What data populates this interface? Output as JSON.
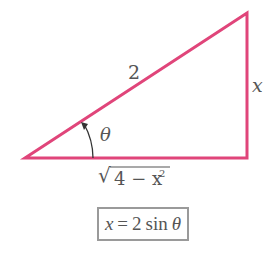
{
  "diagram": {
    "type": "right-triangle",
    "colors": {
      "triangle_stroke": "#e0457a",
      "label_text": "#555555",
      "box_border": "#9a9a9a",
      "arrow": "#333333"
    },
    "vertices": {
      "left": [
        25,
        158
      ],
      "right_bottom": [
        247,
        158
      ],
      "top": [
        247,
        13
      ]
    },
    "labels": {
      "hypotenuse": "2",
      "opposite": "x",
      "angle": "θ",
      "adjacent": {
        "radical": "√",
        "radicand": "4 − x",
        "exponent": "2"
      }
    },
    "formula": {
      "lhs": "x",
      "equals": "=",
      "coefficient": "2",
      "function": "sin",
      "argument": "θ"
    }
  }
}
